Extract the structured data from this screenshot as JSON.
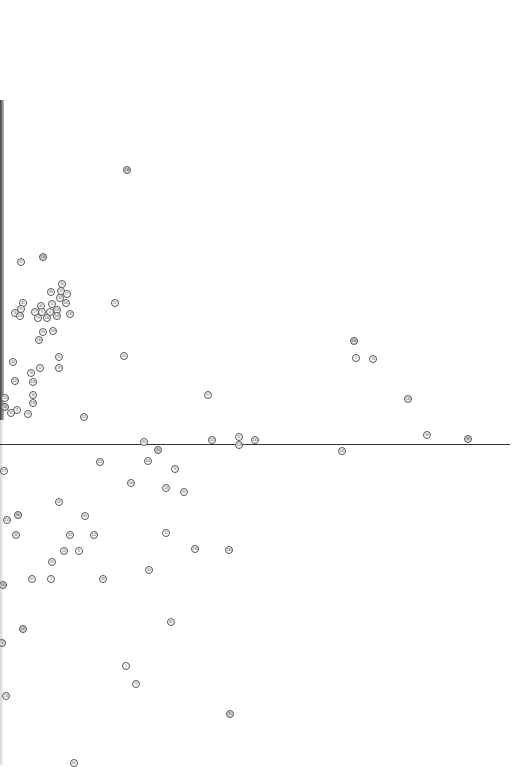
{
  "chart_data": {
    "type": "scatter",
    "title": "",
    "xlabel": "",
    "ylabel": "",
    "grid": false,
    "legend": null,
    "reference_line": {
      "orientation": "horizontal",
      "y_px": 444,
      "x_start_px": 0,
      "x_end_px": 510,
      "color": "#333333"
    },
    "note": "Labeled point markers (small circled ID numbers); coordinates given in screen pixels. Labels are low-resolution best readings.",
    "points": [
      {
        "label": "168",
        "x": 127,
        "y": 170,
        "dark": true
      },
      {
        "label": "37",
        "x": 21,
        "y": 262
      },
      {
        "label": "158",
        "x": 43,
        "y": 257,
        "dark": true
      },
      {
        "label": "30",
        "x": 62,
        "y": 284
      },
      {
        "label": "89",
        "x": 51,
        "y": 292
      },
      {
        "label": "13",
        "x": 61,
        "y": 291
      },
      {
        "label": "17",
        "x": 67,
        "y": 294
      },
      {
        "label": "34",
        "x": 60,
        "y": 298
      },
      {
        "label": "161",
        "x": 66,
        "y": 303
      },
      {
        "label": "21",
        "x": 115,
        "y": 303
      },
      {
        "label": "45",
        "x": 23,
        "y": 303
      },
      {
        "label": "35",
        "x": 21,
        "y": 309
      },
      {
        "label": "76",
        "x": 15,
        "y": 313
      },
      {
        "label": "118",
        "x": 20,
        "y": 316
      },
      {
        "label": "40",
        "x": 41,
        "y": 306
      },
      {
        "label": "11",
        "x": 52,
        "y": 304
      },
      {
        "label": "17",
        "x": 35,
        "y": 312
      },
      {
        "label": "9",
        "x": 42,
        "y": 312
      },
      {
        "label": "6",
        "x": 50,
        "y": 312
      },
      {
        "label": "100",
        "x": 57,
        "y": 310
      },
      {
        "label": "137",
        "x": 70,
        "y": 314
      },
      {
        "label": "78",
        "x": 38,
        "y": 318
      },
      {
        "label": "146",
        "x": 47,
        "y": 318
      },
      {
        "label": "106",
        "x": 57,
        "y": 316
      },
      {
        "label": "90",
        "x": 43,
        "y": 332
      },
      {
        "label": "103",
        "x": 53,
        "y": 331
      },
      {
        "label": "130",
        "x": 39,
        "y": 340
      },
      {
        "label": "154",
        "x": 354,
        "y": 341,
        "dark": true
      },
      {
        "label": "5",
        "x": 356,
        "y": 358
      },
      {
        "label": "76",
        "x": 373,
        "y": 359
      },
      {
        "label": "25",
        "x": 59,
        "y": 357
      },
      {
        "label": "24",
        "x": 124,
        "y": 356
      },
      {
        "label": "44",
        "x": 13,
        "y": 362
      },
      {
        "label": "12",
        "x": 40,
        "y": 368
      },
      {
        "label": "19",
        "x": 59,
        "y": 368
      },
      {
        "label": "76",
        "x": 31,
        "y": 373
      },
      {
        "label": "102",
        "x": 15,
        "y": 381
      },
      {
        "label": "154",
        "x": 33,
        "y": 382
      },
      {
        "label": "27",
        "x": 208,
        "y": 395
      },
      {
        "label": "133",
        "x": 408,
        "y": 399
      },
      {
        "label": "34",
        "x": 33,
        "y": 395
      },
      {
        "label": "138",
        "x": 33,
        "y": 403
      },
      {
        "label": "110",
        "x": 5,
        "y": 398
      },
      {
        "label": "63",
        "x": 5,
        "y": 407,
        "dark": true
      },
      {
        "label": "71",
        "x": 17,
        "y": 410
      },
      {
        "label": "31",
        "x": 11,
        "y": 413
      },
      {
        "label": "76",
        "x": 28,
        "y": 414
      },
      {
        "label": "117",
        "x": 84,
        "y": 417
      },
      {
        "label": "58",
        "x": 427,
        "y": 435
      },
      {
        "label": "98",
        "x": 468,
        "y": 439,
        "dark": true
      },
      {
        "label": "113",
        "x": 212,
        "y": 440
      },
      {
        "label": "31",
        "x": 239,
        "y": 437
      },
      {
        "label": "145",
        "x": 255,
        "y": 440
      },
      {
        "label": "95",
        "x": 144,
        "y": 442
      },
      {
        "label": "119",
        "x": 239,
        "y": 445
      },
      {
        "label": "84",
        "x": 158,
        "y": 450,
        "dark": true
      },
      {
        "label": "141",
        "x": 342,
        "y": 451
      },
      {
        "label": "127",
        "x": 100,
        "y": 462
      },
      {
        "label": "161",
        "x": 148,
        "y": 461
      },
      {
        "label": "177",
        "x": 4,
        "y": 471
      },
      {
        "label": "76",
        "x": 175,
        "y": 469
      },
      {
        "label": "53",
        "x": 166,
        "y": 488
      },
      {
        "label": "40",
        "x": 184,
        "y": 492
      },
      {
        "label": "58",
        "x": 59,
        "y": 502
      },
      {
        "label": "100",
        "x": 131,
        "y": 483
      },
      {
        "label": "86",
        "x": 18,
        "y": 515,
        "dark": true
      },
      {
        "label": "80",
        "x": 85,
        "y": 516
      },
      {
        "label": "153",
        "x": 7,
        "y": 520
      },
      {
        "label": "38",
        "x": 16,
        "y": 535
      },
      {
        "label": "83",
        "x": 70,
        "y": 535
      },
      {
        "label": "122",
        "x": 94,
        "y": 535
      },
      {
        "label": "11",
        "x": 166,
        "y": 533
      },
      {
        "label": "133",
        "x": 195,
        "y": 549
      },
      {
        "label": "135",
        "x": 229,
        "y": 550
      },
      {
        "label": "23",
        "x": 64,
        "y": 551
      },
      {
        "label": "8",
        "x": 79,
        "y": 551
      },
      {
        "label": "83",
        "x": 52,
        "y": 562
      },
      {
        "label": "90",
        "x": 149,
        "y": 570
      },
      {
        "label": "61",
        "x": 32,
        "y": 579
      },
      {
        "label": "2",
        "x": 51,
        "y": 579
      },
      {
        "label": "39",
        "x": 103,
        "y": 579
      },
      {
        "label": "160",
        "x": 3,
        "y": 585,
        "dark": true
      },
      {
        "label": "85",
        "x": 171,
        "y": 622
      },
      {
        "label": "147",
        "x": 23,
        "y": 629,
        "dark": true
      },
      {
        "label": "4",
        "x": 2,
        "y": 643,
        "dark": true
      },
      {
        "label": "1",
        "x": 126,
        "y": 666
      },
      {
        "label": "72",
        "x": 136,
        "y": 684
      },
      {
        "label": "174",
        "x": 6,
        "y": 696
      },
      {
        "label": "95",
        "x": 230,
        "y": 714,
        "dark": true
      },
      {
        "label": "61",
        "x": 74,
        "y": 763
      }
    ]
  }
}
